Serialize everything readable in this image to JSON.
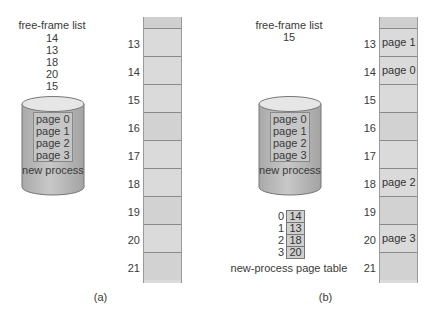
{
  "panel_a": {
    "free_frame_title": "free-frame list",
    "free_frames": [
      "14",
      "13",
      "18",
      "20",
      "15"
    ],
    "disk": {
      "pages": [
        "page 0",
        "page 1",
        "page 2",
        "page 3"
      ],
      "label": "new process"
    },
    "memory": {
      "frames": [
        {
          "number": "13",
          "content": ""
        },
        {
          "number": "14",
          "content": ""
        },
        {
          "number": "15",
          "content": ""
        },
        {
          "number": "16",
          "content": ""
        },
        {
          "number": "17",
          "content": ""
        },
        {
          "number": "18",
          "content": ""
        },
        {
          "number": "19",
          "content": ""
        },
        {
          "number": "20",
          "content": ""
        },
        {
          "number": "21",
          "content": ""
        }
      ]
    },
    "caption": "(a)"
  },
  "panel_b": {
    "free_frame_title": "free-frame list",
    "free_frames": [
      "15"
    ],
    "disk": {
      "pages": [
        "page 0",
        "page 1",
        "page 2",
        "page 3"
      ],
      "label": "new process"
    },
    "page_table": {
      "rows": [
        {
          "index": "0",
          "frame": "14"
        },
        {
          "index": "1",
          "frame": "13"
        },
        {
          "index": "2",
          "frame": "18"
        },
        {
          "index": "3",
          "frame": "20"
        }
      ],
      "label": "new-process page table"
    },
    "memory": {
      "frames": [
        {
          "number": "13",
          "content": "page 1"
        },
        {
          "number": "14",
          "content": "page 0"
        },
        {
          "number": "15",
          "content": ""
        },
        {
          "number": "16",
          "content": ""
        },
        {
          "number": "17",
          "content": ""
        },
        {
          "number": "18",
          "content": "page 2"
        },
        {
          "number": "19",
          "content": ""
        },
        {
          "number": "20",
          "content": "page 3"
        },
        {
          "number": "21",
          "content": ""
        }
      ]
    },
    "caption": "(b)"
  },
  "colors": {
    "frame_fill": "#dadada",
    "frame_border": "#8a8a8a",
    "cylinder_body": "#bdbdbd",
    "cylinder_top": "#e6e6e6",
    "text": "#3a3a3a"
  }
}
